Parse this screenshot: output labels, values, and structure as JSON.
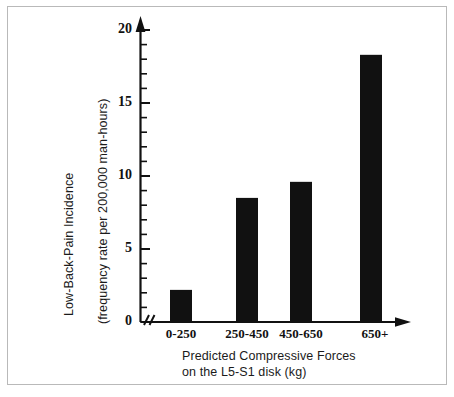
{
  "chart_data": {
    "type": "bar",
    "title": "",
    "subtitle": "",
    "categories": [
      "0-250",
      "250-450",
      "450-650",
      "650+"
    ],
    "values": [
      2.2,
      8.5,
      9.6,
      18.3
    ],
    "series": [
      {
        "name": "Low-Back-Pain Incidence",
        "values": [
          2.2,
          8.5,
          9.6,
          18.3
        ]
      }
    ],
    "xlabel": "Predicted Compressive Forces on the L5-S1 disk (kg)",
    "xlabel_line1": "Predicted Compressive Forces",
    "xlabel_line2": "on the L5-S1 disk (kg)",
    "ylabel": "Low-Back-Pain Incidence (frequency rate per 200,000 man-hours)",
    "ylabel_line1": "Low-Back-Pain Incidence",
    "ylabel_line2": "(frequency rate per 200,000 man-hours)",
    "ylim": [
      0,
      20
    ],
    "ytick_labels": [
      "0",
      "5",
      "10",
      "15",
      "20"
    ],
    "ytick_values": [
      0,
      5,
      10,
      15,
      20
    ],
    "yminor_step": 1,
    "grid": false,
    "legend": "none",
    "bar_color": "#111111",
    "axis_color": "#111111",
    "axis_break_marker": "//"
  },
  "figure": {
    "border_color": "#b9b9b9",
    "background": "#ffffff"
  }
}
